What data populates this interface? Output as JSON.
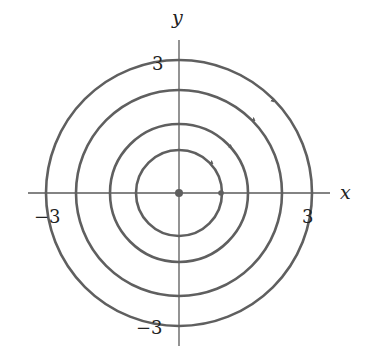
{
  "diagram": {
    "type": "phase_portrait",
    "axes": {
      "x_label": "x",
      "y_label": "y"
    },
    "tick_labels": {
      "x_neg": "−3",
      "x_pos": "3",
      "y_pos": "3",
      "y_neg": "−3"
    },
    "orbits": [
      {
        "radius_units": 1.0,
        "direction": "clockwise"
      },
      {
        "radius_units": 1.55,
        "direction": "clockwise"
      },
      {
        "radius_units": 2.3,
        "direction": "clockwise"
      },
      {
        "radius_units": 3.0,
        "direction": "clockwise"
      }
    ],
    "points": [
      {
        "name": "origin-equilibrium",
        "x": 0,
        "y": 0
      },
      {
        "name": "initial-point",
        "x": 1,
        "y": 0
      }
    ],
    "colors": {
      "curve": "#5f5f5f",
      "axis": "#5a5a5a",
      "text": "#222222"
    }
  }
}
